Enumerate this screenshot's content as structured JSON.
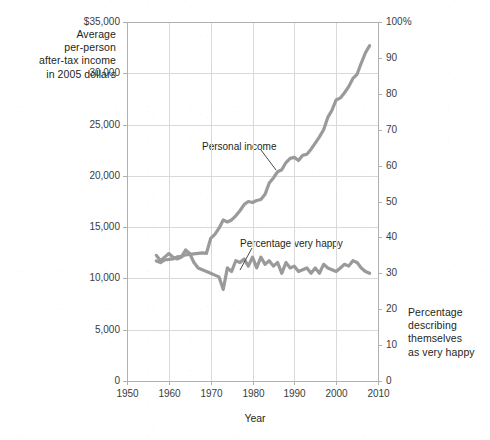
{
  "chart_data": {
    "type": "line",
    "title": "",
    "xlabel": "Year",
    "ylabel_left": "Average per-person after-tax income in 2005 dollars",
    "ylabel_right": "Percentage describing themselves as very happy",
    "ylabel_left_lines": [
      "Average",
      "per-person",
      "after-tax income",
      "in 2005 dollars"
    ],
    "ylabel_right_lines": [
      "Percentage",
      "describing",
      "themselves",
      "as very happy"
    ],
    "xlim": [
      1950,
      2010
    ],
    "xticks": [
      1950,
      1960,
      1970,
      1980,
      1990,
      2000,
      2010
    ],
    "xtick_labels": [
      "1950",
      "1960",
      "1970",
      "1980",
      "1990",
      "2000",
      "2010"
    ],
    "ylim_left": [
      0,
      35000
    ],
    "yticks_left": [
      0,
      5000,
      10000,
      15000,
      20000,
      25000,
      30000,
      35000
    ],
    "ytick_labels_left": [
      "0",
      "5,000",
      "10,000",
      "15,000",
      "20,000",
      "25,000",
      "30,000",
      "$35,000"
    ],
    "ylim_right": [
      0,
      100
    ],
    "yticks_right": [
      0,
      10,
      20,
      30,
      40,
      50,
      60,
      70,
      80,
      90,
      100
    ],
    "ytick_labels_right": [
      "0",
      "10",
      "20",
      "30",
      "40",
      "50",
      "60",
      "70",
      "80",
      "90",
      "100%"
    ],
    "grid": true,
    "legend_position": "inline-annotations",
    "line_color": "#9a9a9a",
    "grid_color": "#d9d9d9",
    "frame_color": "#b0b0b0",
    "annotations": [
      {
        "text": "Personal income",
        "x": 1977.5,
        "y_left": 23300
      },
      {
        "text": "Percentage very happy",
        "x": 1985.5,
        "y_right": 41.5
      }
    ],
    "series": [
      {
        "name": "Personal income",
        "axis": "left",
        "units": "2005 dollars",
        "x": [
          1957,
          1958,
          1959,
          1960,
          1961,
          1962,
          1963,
          1964,
          1965,
          1966,
          1967,
          1968,
          1969,
          1970,
          1971,
          1972,
          1973,
          1974,
          1975,
          1976,
          1977,
          1978,
          1979,
          1980,
          1981,
          1982,
          1983,
          1984,
          1985,
          1986,
          1987,
          1988,
          1989,
          1990,
          1991,
          1992,
          1993,
          1994,
          1995,
          1996,
          1997,
          1998,
          1999,
          2000,
          2001,
          2002,
          2003,
          2004,
          2005,
          2006,
          2007,
          2008
        ],
        "values": [
          11700,
          11550,
          11800,
          11850,
          11900,
          12100,
          12150,
          12300,
          12350,
          12400,
          12450,
          12500,
          12450,
          13900,
          14300,
          14900,
          15700,
          15500,
          15700,
          16100,
          16600,
          17200,
          17500,
          17400,
          17600,
          17700,
          18200,
          19300,
          19800,
          20400,
          20600,
          21300,
          21700,
          21800,
          21500,
          22000,
          22100,
          22600,
          23200,
          23800,
          24500,
          25700,
          26400,
          27400,
          27600,
          28100,
          28700,
          29500,
          29900,
          31000,
          32000,
          32700
        ]
      },
      {
        "name": "Percentage very happy",
        "axis": "right",
        "units": "percent",
        "x": [
          1957,
          1958,
          1959,
          1960,
          1961,
          1962,
          1963,
          1964,
          1965,
          1966,
          1967,
          1968,
          1969,
          1970,
          1971,
          1972,
          1973,
          1974,
          1975,
          1976,
          1977,
          1978,
          1979,
          1980,
          1981,
          1982,
          1983,
          1984,
          1985,
          1986,
          1987,
          1988,
          1989,
          1990,
          1991,
          1992,
          1993,
          1994,
          1995,
          1996,
          1997,
          1998,
          1999,
          2000,
          2001,
          2002,
          2003,
          2004,
          2005,
          2006,
          2007,
          2008
        ],
        "values": [
          35.0,
          33.5,
          34.5,
          35.5,
          34.5,
          34.0,
          34.5,
          36.5,
          35.5,
          33.0,
          31.5,
          31.0,
          30.5,
          30.0,
          29.5,
          29.0,
          25.5,
          31.5,
          30.5,
          33.5,
          33.0,
          34.0,
          32.0,
          34.5,
          31.5,
          34.5,
          32.5,
          33.5,
          32.0,
          33.0,
          30.0,
          33.0,
          31.5,
          32.0,
          30.5,
          31.0,
          31.5,
          30.0,
          31.5,
          30.0,
          32.5,
          31.5,
          31.0,
          30.5,
          31.5,
          32.5,
          32.0,
          33.5,
          33.0,
          31.5,
          30.5,
          30.0
        ]
      }
    ]
  },
  "plot": {
    "left": 127,
    "top": 22,
    "right": 378,
    "bottom": 381
  }
}
